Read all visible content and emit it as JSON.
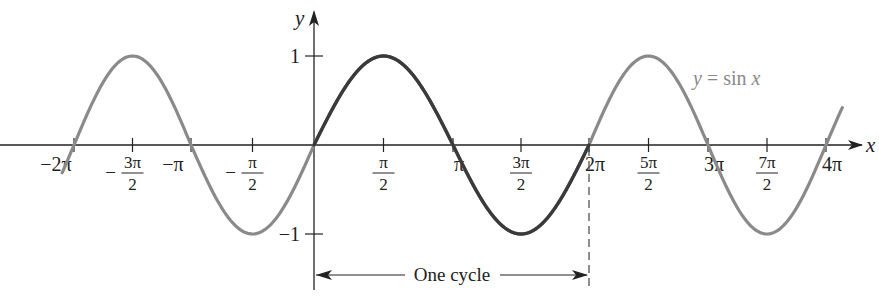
{
  "chart_data": {
    "type": "line",
    "title": "",
    "function_label": "y = sin x",
    "xlabel": "x",
    "ylabel": "y",
    "xlim": [
      -6.2832,
      12.5664
    ],
    "ylim": [
      -1,
      1
    ],
    "grid": false,
    "legend": "none",
    "x_ticks": [
      {
        "value": -6.2832,
        "label": "−2π",
        "type": "plain"
      },
      {
        "value": -4.7124,
        "label": "3π/2",
        "num": "3π",
        "den": "2",
        "neg": true,
        "type": "frac"
      },
      {
        "value": -3.1416,
        "label": "−π",
        "type": "plain"
      },
      {
        "value": -1.5708,
        "label": "π/2",
        "num": "π",
        "den": "2",
        "neg": true,
        "type": "frac"
      },
      {
        "value": 0,
        "label": "",
        "type": "none"
      },
      {
        "value": 1.5708,
        "label": "π/2",
        "num": "π",
        "den": "2",
        "neg": false,
        "type": "frac"
      },
      {
        "value": 3.1416,
        "label": "π",
        "type": "plain"
      },
      {
        "value": 4.7124,
        "label": "3π/2",
        "num": "3π",
        "den": "2",
        "neg": false,
        "type": "frac"
      },
      {
        "value": 6.2832,
        "label": "2π",
        "type": "plain"
      },
      {
        "value": 7.854,
        "label": "5π/2",
        "num": "5π",
        "den": "2",
        "neg": false,
        "type": "frac"
      },
      {
        "value": 9.4248,
        "label": "3π",
        "type": "plain"
      },
      {
        "value": 10.9956,
        "label": "7π/2",
        "num": "7π",
        "den": "2",
        "neg": false,
        "type": "frac"
      },
      {
        "value": 12.5664,
        "label": "4π",
        "type": "plain"
      }
    ],
    "y_ticks": [
      {
        "value": 1,
        "label": "1"
      },
      {
        "value": -1,
        "label": "−1"
      }
    ],
    "series": [
      {
        "name": "sin x (context)",
        "x_range": [
          -6.6,
          13.0
        ],
        "color": "#8a8a8a"
      },
      {
        "name": "sin x (one cycle)",
        "x_range": [
          0,
          6.2832
        ],
        "color": "#3a3a3a"
      }
    ],
    "key_points": {
      "x": [
        -6.2832,
        -4.7124,
        -3.1416,
        -1.5708,
        0,
        1.5708,
        3.1416,
        4.7124,
        6.2832,
        7.854,
        9.4248,
        10.9956,
        12.5664
      ],
      "y": [
        0,
        1,
        0,
        -1,
        0,
        1,
        0,
        -1,
        0,
        1,
        0,
        -1,
        0
      ]
    },
    "annotations": {
      "cycle_label": "One cycle",
      "cycle_from": 0,
      "cycle_to": 6.2832
    }
  }
}
